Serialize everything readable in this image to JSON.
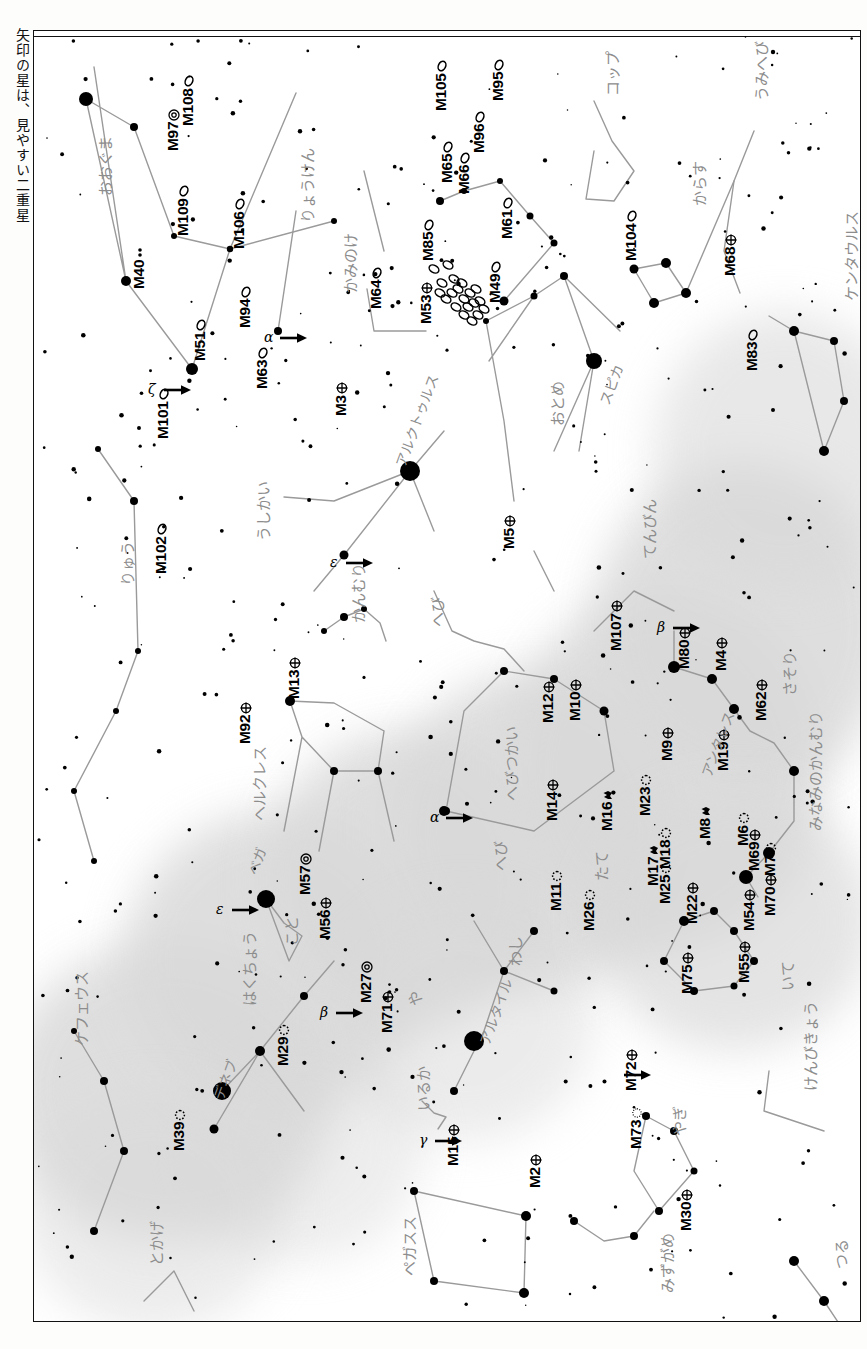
{
  "caption": "矢印の星は、見やすい二重星",
  "chart": {
    "orientation": "rotated-90",
    "frame_color": "#111111",
    "milkyway_color": "#d9d9d9",
    "star_color": "#000000",
    "constellation_line_color": "#9a9a9a",
    "constellation_label_color": "#8d8d8d"
  },
  "messier_objects": [
    {
      "id": "M108",
      "x": 145,
      "y": 95,
      "type": "galaxy",
      "rot": -90
    },
    {
      "id": "M97",
      "x": 130,
      "y": 120,
      "type": "planetary",
      "rot": -90
    },
    {
      "id": "M109",
      "x": 140,
      "y": 205,
      "type": "galaxy",
      "rot": -90
    },
    {
      "id": "M106",
      "x": 196,
      "y": 218,
      "type": "galaxy",
      "rot": -90
    },
    {
      "id": "M40",
      "x": 96,
      "y": 258,
      "type": "double",
      "rot": -90
    },
    {
      "id": "M51",
      "x": 157,
      "y": 330,
      "type": "galaxy",
      "rot": -90
    },
    {
      "id": "M101",
      "x": 120,
      "y": 408,
      "type": "galaxy",
      "rot": -90
    },
    {
      "id": "M63",
      "x": 219,
      "y": 358,
      "type": "galaxy",
      "rot": -90
    },
    {
      "id": "M94",
      "x": 202,
      "y": 297,
      "type": "galaxy",
      "rot": -90
    },
    {
      "id": "M3",
      "x": 298,
      "y": 385,
      "type": "globular",
      "rot": -90
    },
    {
      "id": "M102",
      "x": 118,
      "y": 543,
      "type": "galaxy",
      "rot": -90
    },
    {
      "id": "M64",
      "x": 333,
      "y": 278,
      "type": "galaxy",
      "rot": -90
    },
    {
      "id": "M53",
      "x": 383,
      "y": 293,
      "type": "globular",
      "rot": -90
    },
    {
      "id": "M85",
      "x": 385,
      "y": 230,
      "type": "galaxy",
      "rot": -90
    },
    {
      "id": "M105",
      "x": 398,
      "y": 80,
      "type": "galaxy",
      "rot": -90
    },
    {
      "id": "M96",
      "x": 436,
      "y": 122,
      "type": "galaxy",
      "rot": -90
    },
    {
      "id": "M95",
      "x": 455,
      "y": 70,
      "type": "galaxy",
      "rot": -90
    },
    {
      "id": "M65",
      "x": 404,
      "y": 152,
      "type": "galaxy",
      "rot": -90
    },
    {
      "id": "M66",
      "x": 421,
      "y": 163,
      "type": "galaxy",
      "rot": -90
    },
    {
      "id": "M61",
      "x": 464,
      "y": 208,
      "type": "galaxy",
      "rot": -90
    },
    {
      "id": "M49",
      "x": 452,
      "y": 272,
      "type": "galaxy",
      "rot": -90
    },
    {
      "id": "M104",
      "x": 588,
      "y": 230,
      "type": "galaxy",
      "rot": -90
    },
    {
      "id": "M68",
      "x": 687,
      "y": 245,
      "type": "globular",
      "rot": -90
    },
    {
      "id": "M83",
      "x": 709,
      "y": 340,
      "type": "galaxy",
      "rot": -90
    },
    {
      "id": "M13",
      "x": 251,
      "y": 668,
      "type": "globular",
      "rot": -90
    },
    {
      "id": "M92",
      "x": 202,
      "y": 713,
      "type": "globular",
      "rot": -90
    },
    {
      "id": "M5",
      "x": 466,
      "y": 518,
      "type": "globular",
      "rot": -90
    },
    {
      "id": "M12",
      "x": 505,
      "y": 692,
      "type": "globular",
      "rot": -90
    },
    {
      "id": "M10",
      "x": 532,
      "y": 690,
      "type": "globular",
      "rot": -90
    },
    {
      "id": "M107",
      "x": 573,
      "y": 620,
      "type": "globular",
      "rot": -90
    },
    {
      "id": "M80",
      "x": 641,
      "y": 638,
      "type": "globular",
      "rot": -90
    },
    {
      "id": "M4",
      "x": 678,
      "y": 640,
      "type": "globular",
      "rot": -90
    },
    {
      "id": "M62",
      "x": 718,
      "y": 690,
      "type": "globular",
      "rot": -90
    },
    {
      "id": "M19",
      "x": 680,
      "y": 740,
      "type": "globular",
      "rot": -90
    },
    {
      "id": "M9",
      "x": 624,
      "y": 730,
      "type": "globular",
      "rot": -90
    },
    {
      "id": "M14",
      "x": 509,
      "y": 790,
      "type": "globular",
      "rot": -90
    },
    {
      "id": "M16",
      "x": 564,
      "y": 800,
      "type": "nebula",
      "rot": -90
    },
    {
      "id": "M23",
      "x": 602,
      "y": 785,
      "type": "open",
      "rot": -90
    },
    {
      "id": "M17",
      "x": 610,
      "y": 855,
      "type": "nebula",
      "rot": -90
    },
    {
      "id": "M18",
      "x": 622,
      "y": 838,
      "type": "open",
      "rot": -90
    },
    {
      "id": "M8",
      "x": 662,
      "y": 808,
      "type": "nebula",
      "rot": -90
    },
    {
      "id": "M6",
      "x": 700,
      "y": 815,
      "type": "open",
      "rot": -90
    },
    {
      "id": "M7",
      "x": 727,
      "y": 845,
      "type": "open",
      "rot": -90
    },
    {
      "id": "M69",
      "x": 711,
      "y": 840,
      "type": "globular",
      "rot": -90
    },
    {
      "id": "M70",
      "x": 727,
      "y": 885,
      "type": "globular",
      "rot": -90
    },
    {
      "id": "M54",
      "x": 706,
      "y": 900,
      "type": "globular",
      "rot": -90
    },
    {
      "id": "M22",
      "x": 649,
      "y": 893,
      "type": "globular",
      "rot": -90
    },
    {
      "id": "M25",
      "x": 622,
      "y": 873,
      "type": "open",
      "rot": -90
    },
    {
      "id": "M11",
      "x": 513,
      "y": 880,
      "type": "open",
      "rot": -90
    },
    {
      "id": "M26",
      "x": 546,
      "y": 900,
      "type": "open",
      "rot": -90
    },
    {
      "id": "M55",
      "x": 701,
      "y": 952,
      "type": "globular",
      "rot": -90
    },
    {
      "id": "M75",
      "x": 644,
      "y": 963,
      "type": "globular",
      "rot": -90
    },
    {
      "id": "M29",
      "x": 240,
      "y": 1035,
      "type": "open",
      "rot": -90
    },
    {
      "id": "M39",
      "x": 136,
      "y": 1120,
      "type": "open",
      "rot": -90
    },
    {
      "id": "M57",
      "x": 262,
      "y": 864,
      "type": "planetary",
      "rot": -90
    },
    {
      "id": "M56",
      "x": 282,
      "y": 908,
      "type": "globular",
      "rot": -90
    },
    {
      "id": "M27",
      "x": 323,
      "y": 972,
      "type": "planetary",
      "rot": -90
    },
    {
      "id": "M71",
      "x": 344,
      "y": 1002,
      "type": "globular",
      "rot": -90
    },
    {
      "id": "M15",
      "x": 410,
      "y": 1135,
      "type": "globular",
      "rot": -90
    },
    {
      "id": "M2",
      "x": 492,
      "y": 1157,
      "type": "globular",
      "rot": -90
    },
    {
      "id": "M72",
      "x": 588,
      "y": 1060,
      "type": "globular",
      "rot": -90
    },
    {
      "id": "M73",
      "x": 593,
      "y": 1118,
      "type": "asterism",
      "rot": -90
    },
    {
      "id": "M30",
      "x": 643,
      "y": 1200,
      "type": "globular",
      "rot": -90
    }
  ],
  "constellations": [
    {
      "name": "おおぐま",
      "x": 60,
      "y": 165
    },
    {
      "name": "りょうけん",
      "x": 262,
      "y": 192
    },
    {
      "name": "かみのけ",
      "x": 305,
      "y": 262
    },
    {
      "name": "りゅう",
      "x": 82,
      "y": 555
    },
    {
      "name": "うしかい",
      "x": 218,
      "y": 510
    },
    {
      "name": "かんむり",
      "x": 313,
      "y": 592
    },
    {
      "name": "ヘルクレス",
      "x": 214,
      "y": 790
    },
    {
      "name": "へび",
      "x": 392,
      "y": 596
    },
    {
      "name": "へびつかい",
      "x": 466,
      "y": 770
    },
    {
      "name": "へび",
      "x": 455,
      "y": 840
    },
    {
      "name": "おとめ",
      "x": 512,
      "y": 395
    },
    {
      "name": "てんびん",
      "x": 604,
      "y": 528
    },
    {
      "name": "さそり",
      "x": 744,
      "y": 665
    },
    {
      "name": "みなみのかんむり",
      "x": 770,
      "y": 800
    },
    {
      "name": "おおかみ",
      "x": 822,
      "y": 580
    },
    {
      "name": "ケンタウルス",
      "x": 806,
      "y": 270
    },
    {
      "name": "うみへび",
      "x": 716,
      "y": 70
    },
    {
      "name": "からす",
      "x": 654,
      "y": 175
    },
    {
      "name": "コップ",
      "x": 567,
      "y": 65
    },
    {
      "name": "たて",
      "x": 556,
      "y": 850
    },
    {
      "name": "わし",
      "x": 470,
      "y": 935
    },
    {
      "name": "いるか",
      "x": 378,
      "y": 1080
    },
    {
      "name": "や",
      "x": 370,
      "y": 975
    },
    {
      "name": "こと",
      "x": 246,
      "y": 915
    },
    {
      "name": "はくちょう",
      "x": 204,
      "y": 975
    },
    {
      "name": "とかげ",
      "x": 111,
      "y": 1235
    },
    {
      "name": "ケフェウス",
      "x": 36,
      "y": 1015
    },
    {
      "name": "ペガスス",
      "x": 364,
      "y": 1245
    },
    {
      "name": "みずがめ",
      "x": 622,
      "y": 1262
    },
    {
      "name": "やぎ",
      "x": 634,
      "y": 1105
    },
    {
      "name": "いて",
      "x": 742,
      "y": 960
    },
    {
      "name": "けんびきょう",
      "x": 765,
      "y": 1060
    },
    {
      "name": "つる",
      "x": 796,
      "y": 1238
    }
  ],
  "star_names": [
    {
      "name": "スピカ",
      "x": 560,
      "y": 370
    },
    {
      "name": "アルクトゥルス",
      "x": 356,
      "y": 432
    },
    {
      "name": "アンタレス",
      "x": 662,
      "y": 742
    },
    {
      "name": "ベガ",
      "x": 208,
      "y": 840
    },
    {
      "name": "デネブ",
      "x": 174,
      "y": 1065
    },
    {
      "name": "アルタイル",
      "x": 440,
      "y": 1010
    }
  ],
  "double_stars": [
    {
      "greek": "ζ",
      "x": 128,
      "y": 352,
      "arrow_deg": 0
    },
    {
      "greek": "α",
      "x": 244,
      "y": 300,
      "arrow_deg": 0
    },
    {
      "greek": "ε",
      "x": 310,
      "y": 525,
      "arrow_deg": 0
    },
    {
      "greek": "α",
      "x": 410,
      "y": 780,
      "arrow_deg": 0
    },
    {
      "greek": "β",
      "x": 637,
      "y": 590,
      "arrow_deg": 0
    },
    {
      "greek": "ε",
      "x": 196,
      "y": 872,
      "arrow_deg": 0
    },
    {
      "greek": "β",
      "x": 300,
      "y": 975,
      "arrow_deg": 0
    },
    {
      "greek": "γ",
      "x": 399,
      "y": 1103,
      "arrow_deg": 0
    },
    {
      "greek": "",
      "x": 588,
      "y": 1037,
      "arrow_deg": 0
    }
  ],
  "legend": {
    "galaxy_symbol": "ellipse-outline",
    "globular_symbol": "circle-cross",
    "planetary_symbol": "circle-double",
    "open_symbol": "dotted-circle",
    "nebula_symbol": "irregular-blob"
  }
}
